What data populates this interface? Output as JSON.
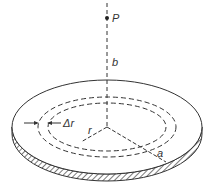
{
  "diagram": {
    "labels": {
      "point": "P",
      "axis_distance": "b",
      "ring_width": "Δr",
      "ring_radius": "r",
      "disk_radius": "a"
    },
    "colors": {
      "line": "#333333",
      "background": "#ffffff"
    }
  }
}
